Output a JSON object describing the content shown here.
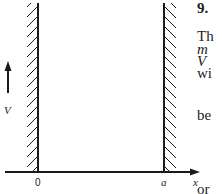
{
  "figure": {
    "labels": {
      "origin": "0",
      "right_wall": "a",
      "x_axis": "x",
      "potential": "V"
    },
    "colors": {
      "ink": "#1a1a1a",
      "background": "#ffffff"
    }
  },
  "side_text": {
    "problem_number": "9.",
    "fragments": [
      "Th",
      "m",
      "V",
      "wi",
      "be",
      "or"
    ]
  }
}
